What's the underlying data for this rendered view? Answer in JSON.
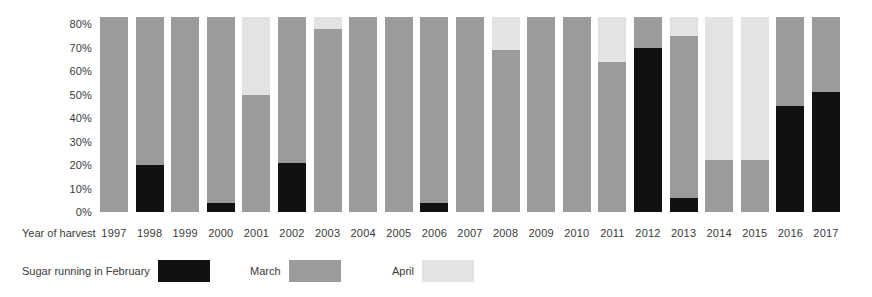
{
  "chart_data": {
    "type": "bar",
    "stacked": true,
    "title": "",
    "subtitle": "",
    "xlabel": "Year of harvest",
    "ylabel": "",
    "ylim": [
      0,
      84
    ],
    "grid": false,
    "legend_position": "bottom-left",
    "ytick_labels": [
      "0%",
      "10%",
      "20%",
      "30%",
      "40%",
      "50%",
      "60%",
      "70%",
      "80%"
    ],
    "ytick_values": [
      0,
      10,
      20,
      30,
      40,
      50,
      60,
      70,
      80
    ],
    "categories": [
      "1997",
      "1998",
      "1999",
      "2000",
      "2001",
      "2002",
      "2003",
      "2004",
      "2005",
      "2006",
      "2007",
      "2008",
      "2009",
      "2010",
      "2011",
      "2012",
      "2013",
      "2014",
      "2015",
      "2016",
      "2017"
    ],
    "series": [
      {
        "name": "Sugar running in February",
        "color": "#111111",
        "values": [
          0,
          20,
          0,
          4,
          0,
          21,
          0,
          0,
          0,
          4,
          0,
          0,
          0,
          0,
          0,
          70,
          6,
          0,
          0,
          45,
          51
        ]
      },
      {
        "name": "March",
        "color": "#9b9b9b",
        "values": [
          83,
          63,
          83,
          79,
          50,
          62,
          78,
          83,
          83,
          79,
          83,
          69,
          83,
          83,
          64,
          13,
          69,
          22,
          22,
          38,
          32
        ]
      },
      {
        "name": "April",
        "color": "#e3e3e3",
        "values": [
          0,
          0,
          0,
          0,
          33,
          0,
          5,
          0,
          0,
          0,
          0,
          14,
          0,
          0,
          19,
          0,
          8,
          61,
          61,
          0,
          0
        ]
      }
    ]
  },
  "axis": {
    "x_title": "Year of harvest"
  },
  "legend": {
    "items": [
      {
        "label": "Sugar running in February",
        "color": "#111111"
      },
      {
        "label": "March",
        "color": "#9b9b9b"
      },
      {
        "label": "April",
        "color": "#e3e3e3"
      }
    ]
  }
}
